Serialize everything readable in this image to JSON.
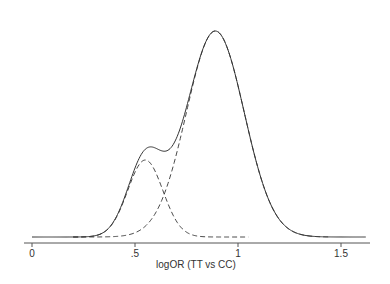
{
  "chart_data": {
    "type": "line",
    "title": "",
    "xlabel": "logOR (TT vs CC)",
    "ylabel": "",
    "xlim": [
      -0.01,
      1.62
    ],
    "x_ticks": [
      0,
      0.5,
      1,
      1.5
    ],
    "x_tick_labels": [
      "0",
      ".5",
      "1",
      "1.5"
    ],
    "grid": false,
    "legend": null,
    "series": [
      {
        "name": "mixture density",
        "style": "solid",
        "x": [
          0,
          0.1,
          0.2,
          0.3,
          0.35,
          0.4,
          0.45,
          0.5,
          0.55,
          0.6,
          0.65,
          0.7,
          0.75,
          0.8,
          0.85,
          0.88,
          0.9,
          0.95,
          1.0,
          1.05,
          1.1,
          1.15,
          1.2,
          1.25,
          1.3,
          1.4,
          1.5,
          1.6
        ],
        "values": [
          0.0,
          0.0,
          0.02,
          0.1,
          0.2,
          0.34,
          0.5,
          0.62,
          0.71,
          0.77,
          0.84,
          0.91,
          0.96,
          1.0,
          1.0,
          1.0,
          0.98,
          0.9,
          0.76,
          0.58,
          0.4,
          0.24,
          0.12,
          0.06,
          0.02,
          0.0,
          0.0,
          0.0
        ]
      },
      {
        "name": "component 1 (small)",
        "style": "dashed",
        "x": [
          0.2,
          0.3,
          0.4,
          0.45,
          0.5,
          0.55,
          0.6,
          0.65,
          0.7,
          0.8,
          0.9,
          1.0,
          1.05
        ],
        "values": [
          0.0,
          0.03,
          0.17,
          0.26,
          0.34,
          0.37,
          0.33,
          0.25,
          0.16,
          0.05,
          0.01,
          0.0,
          0.0
        ]
      },
      {
        "name": "component 2 (large)",
        "style": "dashed",
        "x": [
          0.3,
          0.4,
          0.5,
          0.6,
          0.7,
          0.75,
          0.8,
          0.85,
          0.89,
          0.95,
          1.0,
          1.05,
          1.1,
          1.2,
          1.3,
          1.4
        ],
        "values": [
          0.0,
          0.02,
          0.08,
          0.22,
          0.5,
          0.67,
          0.84,
          0.97,
          1.0,
          0.91,
          0.74,
          0.54,
          0.35,
          0.1,
          0.02,
          0.0
        ]
      }
    ],
    "mixture_params": {
      "baseline_px": 237,
      "x0_px": 32,
      "px_per_unit": 206,
      "component_small": {
        "mean": 0.55,
        "sd": 0.085,
        "peak_px": 77
      },
      "component_large": {
        "mean": 0.89,
        "sd": 0.14,
        "peak_px": 206
      }
    }
  }
}
